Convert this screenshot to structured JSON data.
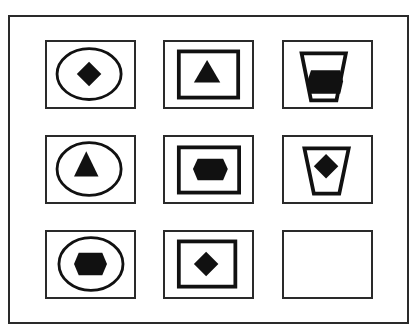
{
  "puzzle": {
    "type": "3x3 figure matrix",
    "colors": {
      "stroke": "#111111",
      "fill": "#111111",
      "background": "#ffffff",
      "border": "#2a2a2a"
    },
    "cells": [
      {
        "row": 1,
        "col": 1,
        "outer": "ellipse",
        "inner": "diamond"
      },
      {
        "row": 1,
        "col": 2,
        "outer": "rectangle",
        "inner": "triangle"
      },
      {
        "row": 1,
        "col": 3,
        "outer": "cup",
        "inner": "hexagon"
      },
      {
        "row": 2,
        "col": 1,
        "outer": "ellipse",
        "inner": "triangle"
      },
      {
        "row": 2,
        "col": 2,
        "outer": "rectangle",
        "inner": "hexagon"
      },
      {
        "row": 2,
        "col": 3,
        "outer": "cup",
        "inner": "diamond"
      },
      {
        "row": 3,
        "col": 1,
        "outer": "ellipse",
        "inner": "hexagon"
      },
      {
        "row": 3,
        "col": 2,
        "outer": "rectangle",
        "inner": "diamond"
      },
      {
        "row": 3,
        "col": 3,
        "outer": "",
        "inner": "",
        "blank": true
      }
    ]
  }
}
